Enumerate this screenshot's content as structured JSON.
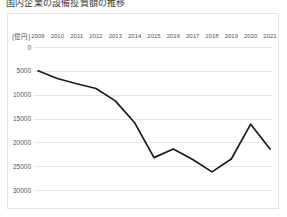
{
  "title": "国内企業の設備投資額の推移",
  "chart_data": {
    "type": "line",
    "title": "国内企業の設備投資額の推移",
    "xlabel": "",
    "ylabel": "(億円)",
    "y_unit": "(億円)",
    "axis_inverted": true,
    "grid": true,
    "legend": "none",
    "ylim": [
      0,
      30000
    ],
    "yticks": [
      "0",
      "5000",
      "10000",
      "15000",
      "20000",
      "25000",
      "30000"
    ],
    "ytick_values": [
      0,
      5000,
      10000,
      15000,
      20000,
      25000,
      30000
    ],
    "categories": [
      "2009",
      "2010",
      "2011",
      "2012",
      "2013",
      "2014",
      "2015",
      "2016",
      "2017",
      "2018",
      "2019",
      "2020",
      "2021"
    ],
    "series": [
      {
        "name": "推移",
        "color": "#1a1a1a",
        "values": [
          5000,
          6600,
          7700,
          8700,
          11300,
          15900,
          23200,
          21400,
          23600,
          26200,
          23500,
          16200,
          21400
        ]
      }
    ]
  },
  "axis": {
    "unit_label": "(億円)",
    "y_ticks": [
      "0",
      "5000",
      "10000",
      "15000",
      "20000",
      "25000",
      "30000"
    ],
    "x_ticks": [
      "2009",
      "2010",
      "2011",
      "2012",
      "2013",
      "2014",
      "2015",
      "2016",
      "2017",
      "2018",
      "2019",
      "2020",
      "2021"
    ]
  }
}
